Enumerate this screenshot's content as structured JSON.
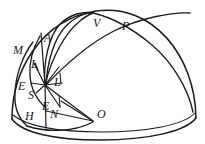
{
  "figure": {
    "kind": "geometric-diagram",
    "ink_color": "#1a1a1a",
    "background_color": "#ffffff",
    "width": 205,
    "height": 144,
    "labels": [
      {
        "id": "M",
        "text": "M",
        "x": 13,
        "y": 44,
        "size": "normal"
      },
      {
        "id": "A",
        "text": "A",
        "x": 44,
        "y": 32,
        "size": "normal"
      },
      {
        "id": "V",
        "text": "V",
        "x": 93,
        "y": 17,
        "size": "normal"
      },
      {
        "id": "P",
        "text": "P",
        "x": 122,
        "y": 20,
        "size": "normal"
      },
      {
        "id": "L1",
        "text": "L",
        "x": 31,
        "y": 58,
        "size": "normal"
      },
      {
        "id": "L2",
        "text": "L",
        "x": 54,
        "y": 76,
        "size": "normal"
      },
      {
        "id": "E1",
        "text": "E",
        "x": 18,
        "y": 80,
        "size": "normal"
      },
      {
        "id": "S",
        "text": "S",
        "x": 28,
        "y": 89,
        "size": "normal"
      },
      {
        "id": "E2",
        "text": "E",
        "x": 42,
        "y": 100,
        "size": "normal"
      },
      {
        "id": "H",
        "text": "H",
        "x": 25,
        "y": 110,
        "size": "normal"
      },
      {
        "id": "N",
        "text": "N",
        "x": 50,
        "y": 108,
        "size": "normal"
      },
      {
        "id": "O",
        "text": "O",
        "x": 97,
        "y": 108,
        "size": "normal"
      }
    ],
    "points": {
      "zenith": {
        "x": 93,
        "y": 13
      },
      "center": {
        "x": 45,
        "y": 85
      },
      "horizon_left": {
        "x": 12,
        "y": 118
      },
      "horizon_right": {
        "x": 196,
        "y": 118
      },
      "O": {
        "x": 93,
        "y": 120
      }
    },
    "curves": [
      {
        "name": "dome-outline",
        "role": "hemisphere boundary"
      },
      {
        "name": "base-ellipse-front",
        "role": "near rim of base circle"
      },
      {
        "name": "base-ellipse-back",
        "role": "far rim of base circle"
      },
      {
        "name": "meridian-arc-1",
        "role": "great circle arc through A"
      },
      {
        "name": "meridian-arc-2",
        "role": "great circle arc through V"
      },
      {
        "name": "meridian-arc-3",
        "role": "great circle arc through P"
      },
      {
        "name": "horizon-arc",
        "role": "arc from M down through E to H"
      },
      {
        "name": "ray-bundle",
        "role": "lines radiating from center point"
      },
      {
        "name": "chord-to-O",
        "role": "lines converging toward O"
      }
    ]
  }
}
